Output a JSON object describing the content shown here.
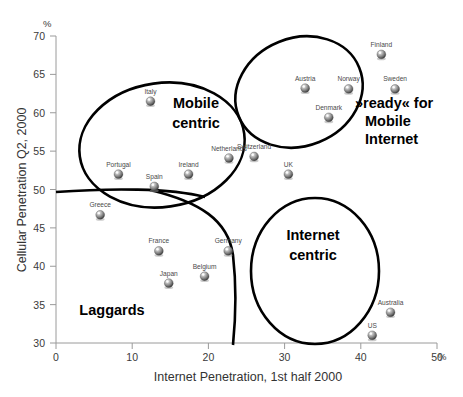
{
  "chart_data": {
    "type": "scatter",
    "title": "",
    "xlabel": "Internet Penetration, 1st half 2000",
    "ylabel": "Cellular Penetration Q2, 2000",
    "x_unit": "%",
    "y_unit": "%",
    "xlim": [
      0,
      50
    ],
    "ylim": [
      30,
      70
    ],
    "x_ticks": [
      0,
      10,
      20,
      30,
      40,
      50
    ],
    "x_tick_labels": [
      "0",
      "10",
      "20",
      "30",
      "40",
      "50"
    ],
    "y_ticks": [
      30,
      35,
      40,
      45,
      50,
      55,
      60,
      65,
      70
    ],
    "y_tick_labels": [
      "30",
      "35",
      "40",
      "45",
      "50",
      "55",
      "60",
      "65",
      "70"
    ],
    "grid": false,
    "legend": "none",
    "points": [
      {
        "label": "Italy",
        "x": 12.4,
        "y": 61.5
      },
      {
        "label": "Portugal",
        "x": 8.2,
        "y": 52.0
      },
      {
        "label": "Spain",
        "x": 12.9,
        "y": 50.4
      },
      {
        "label": "Ireland",
        "x": 17.4,
        "y": 52.0
      },
      {
        "label": "Netherlands",
        "x": 22.7,
        "y": 54.1
      },
      {
        "label": "Switzerland",
        "x": 26.0,
        "y": 54.3
      },
      {
        "label": "UK",
        "x": 30.5,
        "y": 52.0
      },
      {
        "label": "Finland",
        "x": 42.7,
        "y": 67.6
      },
      {
        "label": "Austria",
        "x": 32.7,
        "y": 63.2
      },
      {
        "label": "Norway",
        "x": 38.4,
        "y": 63.1
      },
      {
        "label": "Sweden",
        "x": 44.5,
        "y": 63.1
      },
      {
        "label": "Denmark",
        "x": 35.8,
        "y": 59.4
      },
      {
        "label": "Greece",
        "x": 5.8,
        "y": 46.7
      },
      {
        "label": "France",
        "x": 13.5,
        "y": 42.0
      },
      {
        "label": "Germany",
        "x": 22.6,
        "y": 42.0
      },
      {
        "label": "Belgium",
        "x": 19.5,
        "y": 38.7
      },
      {
        "label": "Japan",
        "x": 14.8,
        "y": 37.8
      },
      {
        "label": "Australia",
        "x": 43.9,
        "y": 34.0
      },
      {
        "label": "US",
        "x": 41.5,
        "y": 31.0
      }
    ],
    "annotations": [
      {
        "name": "mobile-centric",
        "lines": [
          "Mobile",
          "centric"
        ]
      },
      {
        "name": "internet-centric",
        "lines": [
          "Internet",
          "centric"
        ]
      },
      {
        "name": "laggards",
        "lines": [
          "Laggards"
        ]
      },
      {
        "name": "ready-for-mobile-internet",
        "lines": [
          "»ready« for",
          "Mobile",
          "Internet"
        ]
      }
    ]
  },
  "colors": {
    "outline": "#000000",
    "axis": "#9a9a9a",
    "marker_light": "#d4d4d4",
    "marker_dark": "#5a5a5a",
    "text": "#333333"
  }
}
